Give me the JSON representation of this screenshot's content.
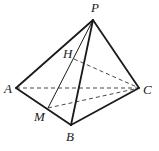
{
  "diagram": {
    "type": "tetrahedron",
    "points": {
      "P": {
        "label": "P",
        "x": 93,
        "y": 20,
        "lx": 91,
        "ly": 12
      },
      "A": {
        "label": "A",
        "x": 16,
        "y": 88,
        "lx": 4,
        "ly": 93
      },
      "B": {
        "label": "B",
        "x": 71,
        "y": 125,
        "lx": 66,
        "ly": 141
      },
      "C": {
        "label": "C",
        "x": 139,
        "y": 88,
        "lx": 143,
        "ly": 94
      },
      "M": {
        "label": "M",
        "x": 48,
        "y": 108,
        "lx": 34,
        "ly": 121
      },
      "H": {
        "label": "H",
        "x": 74,
        "y": 59,
        "lx": 63,
        "ly": 58
      }
    },
    "solid_edges": [
      [
        "P",
        "A"
      ],
      [
        "P",
        "B"
      ],
      [
        "P",
        "C"
      ],
      [
        "A",
        "B"
      ],
      [
        "B",
        "C"
      ]
    ],
    "thin_edges": [
      [
        "P",
        "M"
      ]
    ],
    "dashed_edges": [
      [
        "A",
        "C"
      ],
      [
        "M",
        "C"
      ],
      [
        "H",
        "C"
      ]
    ]
  }
}
